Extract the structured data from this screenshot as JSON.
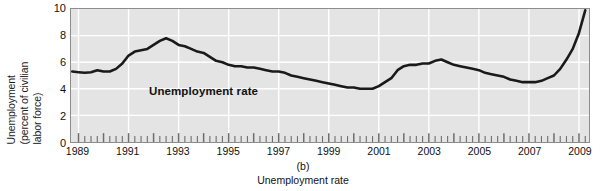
{
  "figure": {
    "panel_letter": "(b)",
    "caption": "Unemployment rate",
    "series_label": "Unemployment rate",
    "colors": {
      "plot_background": "#e4e4e4",
      "gridline": "#ffffff",
      "line": "#1a1a1a",
      "frame": "#8d8d8d",
      "text": "#111111"
    }
  },
  "axis": {
    "y_title_lines": [
      "Unemployment",
      "(percent of civilian",
      "labor force)"
    ],
    "y_ticks": [
      "0",
      "2",
      "4",
      "6",
      "8",
      "10"
    ],
    "x_ticks": [
      "1989",
      "1991",
      "1993",
      "1995",
      "1997",
      "1999",
      "2001",
      "2003",
      "2005",
      "2007",
      "2009"
    ]
  },
  "chart_data": {
    "type": "line",
    "title": "Unemployment rate",
    "subtitle": "(b)",
    "xlabel": "",
    "ylabel": "Unemployment (percent of civilian labor force)",
    "xlim": [
      1988.7,
      2009.4
    ],
    "ylim": [
      0,
      10
    ],
    "ytick_values": [
      0,
      2,
      4,
      6,
      8,
      10
    ],
    "xtick_values": [
      1989,
      1991,
      1993,
      1995,
      1997,
      1999,
      2001,
      2003,
      2005,
      2007,
      2009
    ],
    "grid": true,
    "minor_ticks_per_year": 4,
    "legend": "inside-plot",
    "series": [
      {
        "name": "Unemployment rate",
        "x": [
          1988.75,
          1989.0,
          1989.25,
          1989.5,
          1989.75,
          1990.0,
          1990.25,
          1990.5,
          1990.75,
          1991.0,
          1991.25,
          1991.5,
          1991.75,
          1992.0,
          1992.25,
          1992.5,
          1992.75,
          1993.0,
          1993.25,
          1993.5,
          1993.75,
          1994.0,
          1994.25,
          1994.5,
          1994.75,
          1995.0,
          1995.25,
          1995.5,
          1995.75,
          1996.0,
          1996.25,
          1996.5,
          1996.75,
          1997.0,
          1997.25,
          1997.5,
          1997.75,
          1998.0,
          1998.25,
          1998.5,
          1998.75,
          1999.0,
          1999.25,
          1999.5,
          1999.75,
          2000.0,
          2000.25,
          2000.5,
          2000.75,
          2001.0,
          2001.25,
          2001.5,
          2001.75,
          2002.0,
          2002.25,
          2002.5,
          2002.75,
          2003.0,
          2003.25,
          2003.5,
          2003.75,
          2004.0,
          2004.25,
          2004.5,
          2004.75,
          2005.0,
          2005.25,
          2005.5,
          2005.75,
          2006.0,
          2006.25,
          2006.5,
          2006.75,
          2007.0,
          2007.25,
          2007.5,
          2007.75,
          2008.0,
          2008.25,
          2008.5,
          2008.75,
          2009.0,
          2009.25
        ],
        "y": [
          5.3,
          5.25,
          5.2,
          5.25,
          5.4,
          5.3,
          5.3,
          5.5,
          5.9,
          6.5,
          6.8,
          6.9,
          7.0,
          7.3,
          7.6,
          7.8,
          7.6,
          7.3,
          7.2,
          7.0,
          6.8,
          6.7,
          6.4,
          6.1,
          6.0,
          5.8,
          5.7,
          5.7,
          5.6,
          5.6,
          5.5,
          5.4,
          5.3,
          5.3,
          5.2,
          5.0,
          4.9,
          4.8,
          4.7,
          4.6,
          4.5,
          4.4,
          4.3,
          4.2,
          4.1,
          4.1,
          4.0,
          4.0,
          4.0,
          4.2,
          4.5,
          4.8,
          5.4,
          5.7,
          5.8,
          5.8,
          5.9,
          5.9,
          6.1,
          6.2,
          6.0,
          5.8,
          5.7,
          5.6,
          5.5,
          5.4,
          5.2,
          5.1,
          5.0,
          4.9,
          4.7,
          4.6,
          4.5,
          4.5,
          4.5,
          4.6,
          4.8,
          5.0,
          5.5,
          6.2,
          7.0,
          8.2,
          9.9
        ]
      }
    ]
  }
}
